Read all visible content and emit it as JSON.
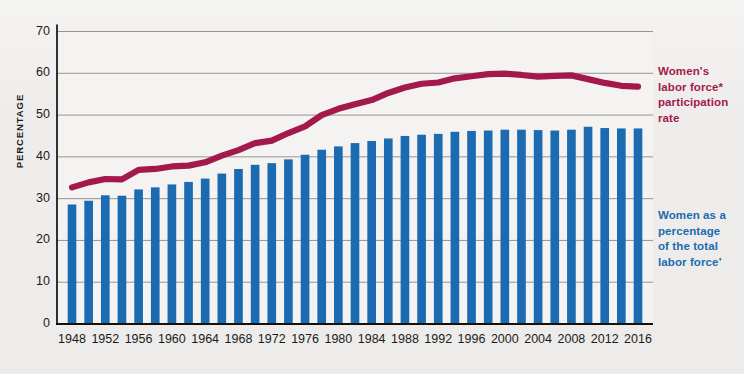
{
  "chart_data": {
    "type": "bar",
    "title": "",
    "xlabel": "",
    "ylabel": "PERCENTAGE",
    "ylim": [
      0,
      70
    ],
    "ytick_labels": [
      "0",
      "10",
      "20",
      "30",
      "40",
      "50",
      "60",
      "70"
    ],
    "yticks": [
      0,
      10,
      20,
      30,
      40,
      50,
      60,
      70
    ],
    "grid": "horizontal",
    "legend_position": "right",
    "xtick_labels": [
      "1948",
      "1952",
      "1956",
      "1960",
      "1964",
      "1968",
      "1972",
      "1976",
      "1980",
      "1984",
      "1988",
      "1992",
      "1996",
      "2000",
      "2004",
      "2008",
      "2012",
      "2016"
    ],
    "x": [
      1948,
      1950,
      1952,
      1954,
      1956,
      1958,
      1960,
      1962,
      1964,
      1966,
      1968,
      1970,
      1972,
      1974,
      1976,
      1978,
      1980,
      1982,
      1984,
      1986,
      1988,
      1990,
      1992,
      1994,
      1996,
      1998,
      2000,
      2002,
      2004,
      2006,
      2008,
      2010,
      2012,
      2014,
      2016
    ],
    "series": [
      {
        "name": "Women as a percentage of the total labor force",
        "type": "bar",
        "color": "#1c6bb0",
        "values": [
          28.6,
          29.5,
          30.8,
          30.7,
          32.2,
          32.7,
          33.4,
          34.0,
          34.8,
          36.0,
          37.1,
          38.1,
          38.5,
          39.4,
          40.5,
          41.7,
          42.5,
          43.3,
          43.8,
          44.4,
          45.0,
          45.3,
          45.5,
          46.0,
          46.2,
          46.3,
          46.5,
          46.5,
          46.4,
          46.3,
          46.5,
          47.2,
          46.9,
          46.8,
          46.8
        ]
      },
      {
        "name": "Women's labor force participation rate",
        "type": "line",
        "color": "#a4194c",
        "values": [
          32.7,
          33.9,
          34.7,
          34.6,
          36.9,
          37.1,
          37.7,
          37.9,
          38.7,
          40.3,
          41.6,
          43.3,
          43.9,
          45.7,
          47.3,
          50.0,
          51.5,
          52.6,
          53.6,
          55.3,
          56.6,
          57.5,
          57.8,
          58.8,
          59.3,
          59.8,
          59.9,
          59.6,
          59.2,
          59.4,
          59.5,
          58.6,
          57.7,
          57.0,
          56.8
        ]
      }
    ],
    "annotations": {
      "line_label": "Women's labor force* participation rate",
      "bar_label": "Women as a percentage of the total labor force’"
    }
  },
  "legend": {
    "red_label": "Women's\nlabor force*\nparticipation\nrate",
    "blue_label": "Women as a\npercentage\nof the total\nlabor force’"
  },
  "colors": {
    "bar": "#1c6bb0",
    "line": "#a4194c",
    "grid": "#8a8a88",
    "axis": "#111111",
    "background": "#eeedeb",
    "plot_background": "#f4f3f1"
  }
}
